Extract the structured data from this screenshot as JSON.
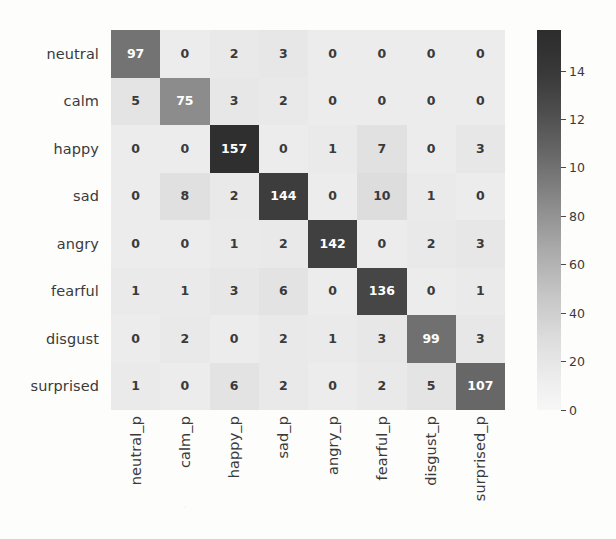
{
  "chart_data": {
    "type": "heatmap",
    "title": "",
    "xlabel": "",
    "ylabel": "",
    "grid": false,
    "legend_position": "right",
    "colormap": "grayscale-reversed",
    "row_labels": [
      "neutral",
      "calm",
      "happy",
      "sad",
      "angry",
      "fearful",
      "disgust",
      "surprised"
    ],
    "col_labels": [
      "neutral_p",
      "calm_p",
      "happy_p",
      "sad_p",
      "angry_p",
      "fearful_p",
      "disgust_p",
      "surprised_p"
    ],
    "values": [
      [
        97,
        0,
        2,
        3,
        0,
        0,
        0,
        0
      ],
      [
        5,
        75,
        3,
        2,
        0,
        0,
        0,
        0
      ],
      [
        0,
        0,
        157,
        0,
        1,
        7,
        0,
        3
      ],
      [
        0,
        8,
        2,
        144,
        0,
        10,
        1,
        0
      ],
      [
        0,
        0,
        1,
        2,
        142,
        0,
        2,
        3
      ],
      [
        1,
        1,
        3,
        6,
        0,
        136,
        0,
        1
      ],
      [
        0,
        2,
        0,
        2,
        1,
        3,
        99,
        3
      ],
      [
        1,
        0,
        6,
        2,
        0,
        2,
        5,
        107
      ]
    ],
    "value_min": 0,
    "value_max": 157,
    "colorbar": {
      "ticks": [
        0,
        20,
        40,
        60,
        80,
        100,
        120,
        140
      ],
      "tick_labels": [
        "0",
        "20",
        "40",
        "60",
        "80",
        "10",
        "12",
        "14"
      ],
      "range": [
        0,
        157
      ]
    }
  },
  "colors": {
    "background": "#fdfdfc",
    "cell_low": "#ececeb",
    "cell_high": "#2f2f2f",
    "text_dark": "#3a3a3a",
    "text_light": "#ffffff"
  }
}
